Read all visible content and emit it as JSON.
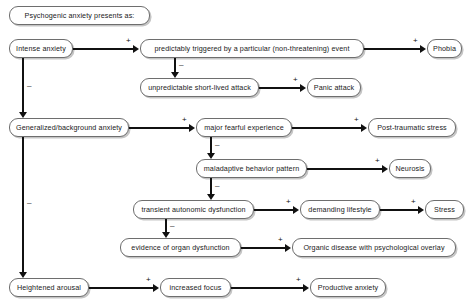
{
  "diagram": {
    "title": "Psychogenic anxiety presents as:",
    "nodes": [
      {
        "id": "title",
        "label": "Psychogenic anxiety presents as:"
      },
      {
        "id": "intense",
        "label": "Intense anxiety"
      },
      {
        "id": "predict",
        "label": "predictably triggered by a particular (non-threatening) event"
      },
      {
        "id": "phobia",
        "label": "Phobia"
      },
      {
        "id": "unpredict",
        "label": "unpredictable short-lived attack"
      },
      {
        "id": "panic",
        "label": "Panic attack"
      },
      {
        "id": "general",
        "label": "Generalized/background anxiety"
      },
      {
        "id": "fearful",
        "label": "major fearful experience"
      },
      {
        "id": "ptsd",
        "label": "Post-traumatic stress"
      },
      {
        "id": "maladapt",
        "label": "maladaptive behavior pattern"
      },
      {
        "id": "neurosis",
        "label": "Neurosis"
      },
      {
        "id": "transient",
        "label": "transient autonomic dysfunction"
      },
      {
        "id": "demanding",
        "label": "demanding lifestyle"
      },
      {
        "id": "stress",
        "label": "Stress"
      },
      {
        "id": "organevid",
        "label": "evidence of organ dysfunction"
      },
      {
        "id": "organdis",
        "label": "Organic disease with psychological overlay"
      },
      {
        "id": "arousal",
        "label": "Heightened arousal"
      },
      {
        "id": "focus",
        "label": "increased focus"
      },
      {
        "id": "productive",
        "label": "Productive anxiety"
      }
    ],
    "edge_signs": {
      "intense_to_predict": "+",
      "intense_to_general": "–",
      "predict_to_phobia": "+",
      "predict_to_unpredict": "–",
      "unpredict_to_panic": "+",
      "general_to_fearful": "+",
      "general_to_arousal": "–",
      "fearful_to_ptsd": "+",
      "fearful_to_maladapt": "–",
      "maladapt_to_neurosis": "+",
      "maladapt_to_transient": "–",
      "transient_to_demanding": "+",
      "transient_to_organevid": "–",
      "demanding_to_stress": "+",
      "organevid_to_organdis": "+",
      "arousal_to_focus": "+",
      "focus_to_productive": "+"
    },
    "colors": {
      "box_border": "#6e6e6e",
      "box_fill": "#ffffff",
      "edge": "#111111",
      "text": "#1a1a1a"
    }
  }
}
